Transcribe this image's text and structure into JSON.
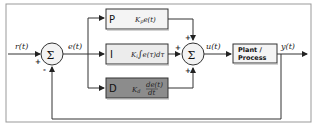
{
  "diagram": {
    "signals": {
      "reference": "r(t)",
      "error": "e(t)",
      "control": "u(t)",
      "output": "y(t)"
    },
    "summing_junction_1": {
      "symbol": "Σ",
      "signs": [
        "+",
        "-"
      ]
    },
    "summing_junction_2": {
      "symbol": "Σ",
      "signs": [
        "+",
        "+",
        "+"
      ]
    },
    "blocks": {
      "p": {
        "letter": "P",
        "equation": "Kₚe(t)"
      },
      "i": {
        "letter": "I",
        "equation": "Kᵢ∫e(τ)dτ"
      },
      "d": {
        "letter": "D",
        "equation": "K_d de(t)/dt"
      }
    },
    "plant": {
      "line1": "Plant /",
      "line2": "Process"
    },
    "colors": {
      "p_block": "#f4f4f4",
      "i_block": "#e8e8e8",
      "d_block": "#8c8c8c",
      "line": "#333333",
      "frame": "#888888"
    }
  }
}
